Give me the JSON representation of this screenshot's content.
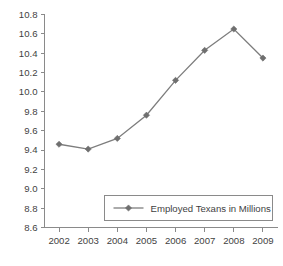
{
  "chart_data": {
    "type": "line",
    "title": "",
    "subtitle": "",
    "xlabel": "",
    "ylabel": "",
    "categories": [
      "2002",
      "2003",
      "2004",
      "2005",
      "2006",
      "2007",
      "2008",
      "2009"
    ],
    "x": [
      2002,
      2003,
      2004,
      2005,
      2006,
      2007,
      2008,
      2009
    ],
    "series": [
      {
        "name": "Employed Texans in Millions",
        "values": [
          9.46,
          9.41,
          9.52,
          9.76,
          10.12,
          10.43,
          10.65,
          10.35
        ],
        "color": "#7d7d7d",
        "marker": "diamond"
      }
    ],
    "ylim": [
      8.6,
      10.8
    ],
    "yticks": [
      8.6,
      8.8,
      9.0,
      9.2,
      9.4,
      9.6,
      9.8,
      10.0,
      10.2,
      10.4,
      10.6,
      10.8
    ],
    "ytick_labels": [
      "8.6",
      "8.8",
      "9.0",
      "9.2",
      "9.4",
      "9.6",
      "9.8",
      "10.0",
      "10.2",
      "10.4",
      "10.6",
      "10.8"
    ],
    "xtick_labels": [
      "2002",
      "2003",
      "2004",
      "2005",
      "2006",
      "2007",
      "2008",
      "2009"
    ],
    "grid": false,
    "legend": {
      "position": "inside-bottom-right",
      "entries": [
        "Employed Texans in Millions"
      ]
    },
    "colors": {
      "line": "#7d7d7d",
      "marker": "#6f6f6f",
      "axis": "#8a8a8a",
      "text": "#3f3f3f",
      "background": "#ffffff"
    }
  }
}
